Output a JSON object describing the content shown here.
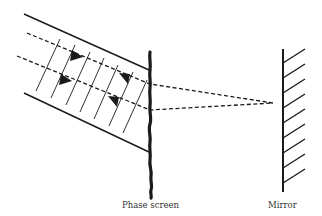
{
  "diagram": {
    "title": "",
    "labels": {
      "phase_screen": "Phase screen",
      "mirror": "Mirror"
    },
    "elements": {
      "incoming_beam": "Collimated beam bounded by two solid edge lines, with oblique wavefront hatch lines",
      "optical_paths": "Two dashed ray paths through beam, converging to a point on the mirror",
      "forward_arrows": 2,
      "return_arrows": 2,
      "phase_screen": "Thick irregular vertical line",
      "mirror": "Vertical line with diagonal hatching on the right"
    },
    "colors": {
      "ink": "#1a1a1a",
      "background": "#ffffff",
      "label_text": "#333333"
    }
  }
}
